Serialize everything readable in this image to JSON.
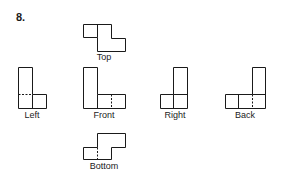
{
  "problem_number": "8.",
  "views": {
    "top": {
      "label": "Top"
    },
    "left": {
      "label": "Left"
    },
    "front": {
      "label": "Front"
    },
    "right": {
      "label": "Right"
    },
    "back": {
      "label": "Back"
    },
    "bottom": {
      "label": "Bottom"
    }
  },
  "colors": {
    "line": "#1a1a1a",
    "background": "#ffffff"
  }
}
